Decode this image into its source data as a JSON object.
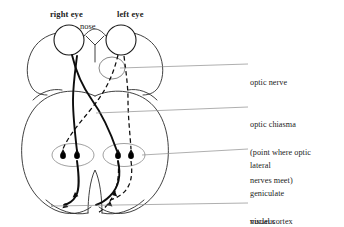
{
  "figure": {
    "background_color": "#ffffff",
    "ink_color": "#1a1a1a",
    "leader_line_color": "#8c8c8c",
    "outline_color": "#3a3a3a"
  },
  "top_labels": {
    "right_eye": "right eye",
    "left_eye": "left eye",
    "nose": "nose"
  },
  "right_labels": [
    {
      "id": "optic-nerve",
      "lines": [
        "optic nerve"
      ]
    },
    {
      "id": "optic-chiasma",
      "lines": [
        "optic chiasma",
        "(point where optic",
        "nerves meet)"
      ]
    },
    {
      "id": "lgn",
      "lines": [
        "lateral",
        "geniculate",
        "nucleus"
      ]
    },
    {
      "id": "visual-cortex",
      "lines": [
        "visual cortex"
      ]
    }
  ],
  "right_labels_text": {
    "optic_nerve": "optic nerve",
    "optic_chiasma_l1": "optic chiasma",
    "optic_chiasma_l2": "(point where optic",
    "optic_chiasma_l3": "nerves meet)",
    "lgn_l1": "lateral",
    "lgn_l2": "geniculate",
    "lgn_l3": "nucleus",
    "visual_cortex": "visual cortex"
  },
  "structures": {
    "eyes": [
      {
        "side": "right",
        "cx": 69,
        "cy": 40,
        "r": 15
      },
      {
        "side": "left",
        "cx": 121,
        "cy": 40,
        "r": 15
      }
    ],
    "lateral_geniculate_nuclei": [
      {
        "side": "right",
        "cx": 73,
        "cy": 155,
        "rx": 20,
        "ry": 11
      },
      {
        "side": "left",
        "cx": 124,
        "cy": 155,
        "rx": 20,
        "ry": 11
      }
    ],
    "synapse_dots": [
      {
        "cx": 63,
        "cy": 156
      },
      {
        "cx": 77,
        "cy": 156
      },
      {
        "cx": 118,
        "cy": 156
      },
      {
        "cx": 131,
        "cy": 156
      }
    ],
    "optic_nerve_callout_ellipse": {
      "cx": 112,
      "cy": 68,
      "rx": 13,
      "ry": 11
    },
    "pathway_style": {
      "right_eye_tracts": "solid",
      "left_eye_tracts": "dashed"
    }
  }
}
